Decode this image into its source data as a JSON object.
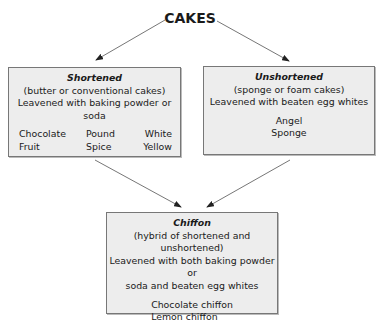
{
  "diagram": {
    "root": {
      "label": "CAKES"
    },
    "nodes": [
      {
        "id": "shortened",
        "heading": "Shortened",
        "subtitle": "(butter or conventional cakes)",
        "description": "Leavened with baking powder or soda",
        "examples": [
          "Chocolate",
          "Pound",
          "White",
          "Fruit",
          "Spice",
          "Yellow"
        ]
      },
      {
        "id": "unshortened",
        "heading": "Unshortened",
        "subtitle": "(sponge or foam cakes)",
        "description": "Leavened with beaten egg whites",
        "examples": [
          "Angel",
          "Sponge"
        ]
      },
      {
        "id": "chiffon",
        "heading": "Chiffon",
        "subtitle": "(hybrid of shortened and unshortened)",
        "description_line1": "Leavened with both baking powder or",
        "description_line2": "soda and beaten egg whites",
        "examples": [
          "Chocolate chiffon",
          "Lemon chiffon"
        ]
      }
    ],
    "edges": [
      {
        "from": "CAKES",
        "to": "shortened"
      },
      {
        "from": "CAKES",
        "to": "unshortened"
      },
      {
        "from": "shortened",
        "to": "chiffon"
      },
      {
        "from": "unshortened",
        "to": "chiffon"
      }
    ],
    "colors": {
      "box_fill": "#ededed",
      "box_border": "#777777",
      "arrow": "#555555",
      "text": "#1a1a1a"
    }
  }
}
